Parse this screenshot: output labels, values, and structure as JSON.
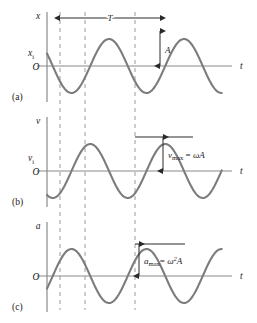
{
  "figure": {
    "width": 257,
    "height": 323,
    "curve_color": "#7c7c7c",
    "axis_color": "#8a8a8a",
    "dashed_color": "#9a9a9a",
    "text_color": "#1a1a1a",
    "background": "#ffffff"
  },
  "geometry": {
    "axis_x": 47,
    "axis_right": 232,
    "t_label_x": 240,
    "dashed_lines_x": [
      60,
      85,
      135
    ],
    "period_px": 75,
    "phase_shift_px": 13,
    "amplitude_px": 27,
    "panels_top": [
      8,
      113,
      218
    ],
    "panel_height": 105,
    "baseline_offset": 58
  },
  "panels": [
    {
      "id": "displacement",
      "letter": "(c-panel-a)",
      "letter_label": "(a)",
      "axis_label": "x",
      "origin_label": "O",
      "time_label": "t",
      "initial_value_label": "x",
      "initial_value_sub": "i",
      "has_initial_value": true,
      "curve_type": "cosine",
      "annotations": {
        "period": {
          "label": "T",
          "from_x": 60,
          "to_x": 160,
          "y": 18
        },
        "amplitude": {
          "label": "A",
          "x": 160,
          "top_y": 31,
          "bottom_y": 66
        }
      }
    },
    {
      "id": "velocity",
      "letter_label": "(b)",
      "axis_label": "v",
      "origin_label": "O",
      "time_label": "t",
      "initial_value_label": "v",
      "initial_value_sub": "i",
      "has_initial_value": true,
      "curve_type": "negative-sine",
      "annotations": {
        "maximum": {
          "symbol": "v",
          "subscript": "max",
          "equals": " = ",
          "expression": "ωA",
          "tick_from_x": 135,
          "tick_to_x": 193,
          "top_y": 137,
          "bottom_y": 171,
          "arrow_x": 163,
          "text_x": 168
        }
      }
    },
    {
      "id": "acceleration",
      "letter_label": "(c)",
      "axis_label": "a",
      "origin_label": "O",
      "time_label": "t",
      "has_initial_value": false,
      "curve_type": "negative-cosine",
      "annotations": {
        "maximum": {
          "symbol": "a",
          "subscript": "max",
          "equals": "= ",
          "expression_base": "ω",
          "expression_exp": "2",
          "expression_tail": "A",
          "tick_from_x": 135,
          "tick_to_x": 185,
          "top_y": 244,
          "bottom_y": 276,
          "arrow_x": 139,
          "text_x": 144
        }
      }
    }
  ]
}
